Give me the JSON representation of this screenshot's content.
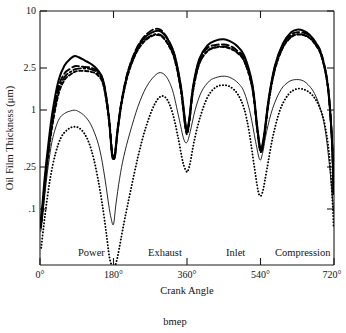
{
  "figure": {
    "caption": "bmep",
    "background": "#ffffff",
    "ink_color": "#000000"
  },
  "chart_data": {
    "type": "line",
    "title": "",
    "xlabel": "Crank Angle",
    "ylabel": "Oil Film Thickness (μm)",
    "xlim": [
      0,
      720
    ],
    "ylim": [
      0.07,
      10
    ],
    "yscale": "log",
    "grid": false,
    "legend": "none",
    "xticks": [
      0,
      180,
      360,
      540,
      720
    ],
    "xticklabels": [
      "0°",
      "180°",
      "360°",
      "540°",
      "720°"
    ],
    "yticks": [
      10,
      2.5,
      1,
      0.25,
      0.1
    ],
    "yticklabels": [
      "10",
      "2.5",
      "1",
      ".25",
      ".1"
    ],
    "annotations": [
      {
        "text": "Power",
        "x": 90,
        "y": 0.082
      },
      {
        "text": "Exhaust",
        "x": 270,
        "y": 0.082
      },
      {
        "text": "Inlet",
        "x": 450,
        "y": 0.082
      },
      {
        "text": "Compression",
        "x": 625,
        "y": 0.082
      }
    ],
    "series": [
      {
        "name": "curve-solid-thick",
        "style": "solid-thick",
        "x": [
          2,
          6,
          12,
          20,
          30,
          45,
          60,
          75,
          85,
          95,
          110,
          125,
          140,
          155,
          168,
          176,
          180,
          184,
          190,
          200,
          215,
          235,
          255,
          275,
          290,
          300,
          315,
          330,
          345,
          355,
          360,
          366,
          375,
          390,
          410,
          430,
          450,
          465,
          480,
          500,
          520,
          532,
          540,
          548,
          560,
          575,
          595,
          615,
          630,
          645,
          660,
          675,
          690,
          705,
          715,
          719
        ],
        "y": [
          0.17,
          0.23,
          0.4,
          0.72,
          1.35,
          2.55,
          3.45,
          3.95,
          4.15,
          4.05,
          3.8,
          3.55,
          3.2,
          2.55,
          1.3,
          0.62,
          0.56,
          0.6,
          0.95,
          1.7,
          3.0,
          4.6,
          5.9,
          6.6,
          6.8,
          6.55,
          5.6,
          4.2,
          2.3,
          1.2,
          0.98,
          1.25,
          2.3,
          3.9,
          5.1,
          5.6,
          5.75,
          5.55,
          5.15,
          4.2,
          2.4,
          1.05,
          0.68,
          0.85,
          1.8,
          3.4,
          5.3,
          6.6,
          6.95,
          6.8,
          6.3,
          5.4,
          4.2,
          2.3,
          0.8,
          0.28
        ]
      },
      {
        "name": "curve-dashed",
        "style": "dashed",
        "x": [
          2,
          6,
          12,
          20,
          30,
          45,
          60,
          75,
          85,
          95,
          110,
          125,
          140,
          155,
          168,
          176,
          180,
          184,
          190,
          200,
          215,
          235,
          255,
          275,
          290,
          300,
          315,
          330,
          345,
          355,
          360,
          366,
          375,
          390,
          410,
          430,
          450,
          465,
          480,
          500,
          520,
          532,
          540,
          548,
          560,
          575,
          595,
          615,
          630,
          645,
          660,
          675,
          690,
          705,
          715,
          719
        ],
        "y": [
          0.155,
          0.21,
          0.36,
          0.65,
          1.2,
          2.25,
          2.95,
          3.25,
          3.4,
          3.4,
          3.35,
          3.3,
          3.1,
          2.55,
          1.35,
          0.66,
          0.58,
          0.63,
          1.0,
          1.75,
          3.05,
          4.7,
          6.05,
          6.9,
          7.05,
          6.7,
          5.6,
          4.15,
          2.25,
          1.15,
          0.95,
          1.22,
          2.25,
          3.8,
          4.85,
          5.15,
          5.2,
          5.05,
          4.7,
          3.95,
          2.3,
          1.02,
          0.66,
          0.82,
          1.75,
          3.3,
          5.15,
          6.3,
          6.6,
          6.55,
          6.2,
          5.4,
          4.25,
          2.35,
          0.82,
          0.29
        ]
      },
      {
        "name": "curve-dashdot",
        "style": "dashdot",
        "x": [
          2,
          6,
          12,
          20,
          30,
          45,
          60,
          75,
          85,
          95,
          110,
          125,
          140,
          155,
          168,
          176,
          180,
          184,
          190,
          200,
          215,
          235,
          255,
          275,
          290,
          300,
          315,
          330,
          345,
          355,
          360,
          366,
          375,
          390,
          410,
          430,
          450,
          465,
          480,
          500,
          520,
          532,
          540,
          548,
          560,
          575,
          595,
          615,
          630,
          645,
          660,
          675,
          690,
          705,
          715,
          719
        ],
        "y": [
          0.15,
          0.2,
          0.34,
          0.62,
          1.12,
          2.1,
          2.75,
          3.05,
          3.2,
          3.25,
          3.25,
          3.2,
          3.0,
          2.45,
          1.3,
          0.65,
          0.57,
          0.62,
          0.98,
          1.7,
          2.9,
          4.45,
          5.6,
          6.25,
          6.35,
          6.1,
          5.2,
          3.9,
          2.15,
          1.12,
          0.93,
          1.18,
          2.15,
          3.6,
          4.6,
          4.95,
          5.0,
          4.85,
          4.55,
          3.8,
          2.25,
          1.0,
          0.65,
          0.8,
          1.7,
          3.2,
          4.95,
          6.05,
          6.35,
          6.3,
          5.95,
          5.2,
          4.1,
          2.28,
          0.8,
          0.285
        ]
      },
      {
        "name": "curve-shortdash",
        "style": "shortdash",
        "x": [
          2,
          6,
          12,
          20,
          30,
          45,
          60,
          75,
          85,
          95,
          110,
          125,
          140,
          155,
          168,
          176,
          180,
          184,
          190,
          200,
          215,
          235,
          255,
          275,
          290,
          300,
          315,
          330,
          345,
          355,
          360,
          366,
          375,
          390,
          410,
          430,
          450,
          465,
          480,
          500,
          520,
          532,
          540,
          548,
          560,
          575,
          595,
          615,
          630,
          645,
          660,
          675,
          690,
          705,
          715,
          719
        ],
        "y": [
          0.145,
          0.195,
          0.33,
          0.59,
          1.05,
          1.95,
          2.6,
          2.9,
          3.05,
          3.1,
          3.1,
          3.05,
          2.88,
          2.35,
          1.25,
          0.63,
          0.555,
          0.605,
          0.95,
          1.65,
          2.85,
          4.35,
          5.5,
          6.15,
          6.25,
          6.0,
          5.1,
          3.85,
          2.1,
          1.08,
          0.9,
          1.15,
          2.1,
          3.55,
          4.55,
          4.9,
          4.95,
          4.8,
          4.5,
          3.75,
          2.2,
          0.98,
          0.64,
          0.79,
          1.68,
          3.15,
          4.9,
          6.0,
          6.3,
          6.25,
          5.9,
          5.15,
          4.05,
          2.25,
          0.79,
          0.28
        ]
      },
      {
        "name": "curve-thin-solid",
        "style": "thin",
        "x": [
          2,
          6,
          12,
          20,
          30,
          45,
          60,
          75,
          85,
          95,
          110,
          125,
          140,
          150,
          160,
          168,
          174,
          180,
          186,
          195,
          205,
          220,
          240,
          260,
          280,
          295,
          310,
          325,
          340,
          352,
          360,
          368,
          380,
          395,
          415,
          435,
          452,
          468,
          485,
          500,
          515,
          528,
          538,
          545,
          555,
          570,
          590,
          610,
          628,
          645,
          660,
          672,
          685,
          698,
          710,
          719
        ],
        "y": [
          0.135,
          0.175,
          0.28,
          0.48,
          0.8,
          1.18,
          1.35,
          1.42,
          1.44,
          1.4,
          1.28,
          1.08,
          0.8,
          0.58,
          0.36,
          0.23,
          0.175,
          0.155,
          0.23,
          0.38,
          0.58,
          0.92,
          1.55,
          2.25,
          2.8,
          3.0,
          2.75,
          2.1,
          1.25,
          0.82,
          0.77,
          0.95,
          1.45,
          2.05,
          2.55,
          2.75,
          2.8,
          2.7,
          2.45,
          2.05,
          1.35,
          0.78,
          0.55,
          0.62,
          0.95,
          1.5,
          2.15,
          2.52,
          2.62,
          2.55,
          2.3,
          2.0,
          1.55,
          1.0,
          0.45,
          0.2
        ]
      },
      {
        "name": "curve-dotted",
        "style": "dotted",
        "x": [
          3,
          8,
          15,
          25,
          38,
          52,
          68,
          82,
          95,
          108,
          120,
          132,
          145,
          155,
          163,
          170,
          176,
          180,
          184,
          190,
          198,
          208,
          222,
          240,
          258,
          278,
          295,
          310,
          325,
          338,
          350,
          358,
          362,
          368,
          378,
          392,
          410,
          430,
          450,
          468,
          485,
          500,
          512,
          524,
          534,
          540,
          546,
          556,
          570,
          588,
          608,
          628,
          648,
          666,
          682,
          696,
          708,
          716,
          719
        ],
        "y": [
          0.098,
          0.14,
          0.22,
          0.38,
          0.62,
          0.85,
          0.99,
          1.04,
          1.02,
          0.92,
          0.76,
          0.55,
          0.33,
          0.2,
          0.125,
          0.082,
          0.069,
          0.067,
          0.069,
          0.082,
          0.115,
          0.175,
          0.3,
          0.58,
          1.0,
          1.55,
          1.88,
          1.8,
          1.35,
          0.85,
          0.52,
          0.44,
          0.44,
          0.52,
          0.8,
          1.25,
          1.85,
          2.25,
          2.35,
          2.25,
          1.95,
          1.48,
          0.95,
          0.5,
          0.3,
          0.27,
          0.3,
          0.46,
          0.85,
          1.45,
          1.95,
          2.18,
          2.15,
          1.95,
          1.6,
          1.15,
          0.62,
          0.25,
          0.145
        ]
      }
    ]
  }
}
